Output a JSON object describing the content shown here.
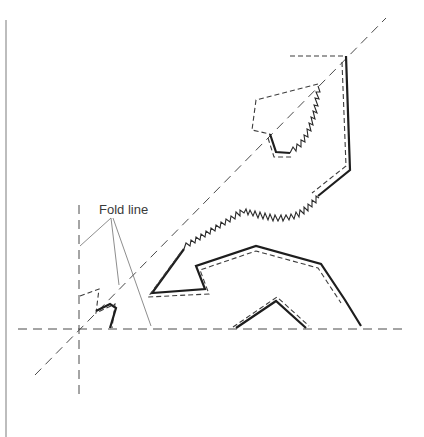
{
  "diagram": {
    "labels": {
      "fold_line": "Fold line"
    },
    "legend_styles": {
      "cut_edge": "solid thick line",
      "seam_line": "short dashed line",
      "fold_line": "long dashed line",
      "zigzag_edge": "zigzag stitched edge"
    },
    "colors": {
      "background": "#ffffff",
      "ink": "#1e1e1e",
      "seam": "#3c3c3c",
      "fold": "#4a4a4a",
      "leader": "#707070",
      "border": "#9a9a9a"
    },
    "fold_lines": {
      "horizontal": {
        "x1": 18,
        "y1": 329,
        "x2": 405,
        "y2": 329
      },
      "vertical": {
        "x1": 79,
        "y1": 205,
        "x2": 79,
        "y2": 400
      },
      "diagonal": {
        "x1": 35,
        "y1": 375,
        "x2": 386,
        "y2": 18
      }
    },
    "label_position": {
      "x": 99,
      "y": 214
    }
  }
}
